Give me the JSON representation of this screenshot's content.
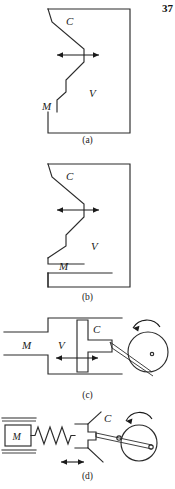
{
  "page": {
    "number": "37",
    "background": "#ffffff",
    "ink": "#1a1a1a"
  },
  "figure_labels": {
    "cam": "C",
    "mass": "M",
    "valve": "V"
  },
  "panels": [
    {
      "id": "a",
      "caption": "(a)",
      "labels": {
        "cam": "C",
        "mass": "M",
        "valve": "V"
      },
      "description": "Valve V inside a housing with cam C profile on the left; stem continues down to mass M; double-headed horizontal arrow at the cam contact point indicating lateral motion. Mass M is attached to the valve stem.",
      "arrow": "double-headed-horizontal"
    },
    {
      "id": "b",
      "caption": "(b)",
      "labels": {
        "cam": "C",
        "mass": "M",
        "valve": "V"
      },
      "description": "Same valve V and cam C arrangement as (a), but mass M is a separate detached block below the valve body.",
      "arrow": "double-headed-horizontal"
    },
    {
      "id": "c",
      "caption": "(c)",
      "labels": {
        "cam": "C",
        "mass": "M",
        "valve": "V"
      },
      "description": "Slider-crank: chamber M on the left connected to chamber V; T-shaped piston C driven by a connecting rod from a rotating crank disc on the right. Rotation arrow is counter-clockwise above the disc; double-headed horizontal arrow shows piston travel.",
      "arrow": "double-headed-horizontal",
      "rotation": "counter-clockwise"
    },
    {
      "id": "d",
      "caption": "(d)",
      "labels": {
        "cam": "C",
        "mass": "M"
      },
      "description": "Mass M on a ground-supported guide, connected by a coil spring to follower C, which is driven by a connecting rod from a rotating crank disc. Double-headed horizontal arrow shows follower travel.",
      "arrow": "double-headed-horizontal",
      "rotation": "counter-clockwise",
      "spring_coils": 7
    }
  ],
  "icons": {
    "rotation_arrow": "curved-rotation-arrow-icon",
    "travel_arrow": "double-headed-arrow-icon",
    "spring": "coil-spring-icon",
    "ground": "ground-hatch-icon",
    "crank_disc": "crank-disc-icon",
    "pin_joint": "pin-joint-icon"
  }
}
